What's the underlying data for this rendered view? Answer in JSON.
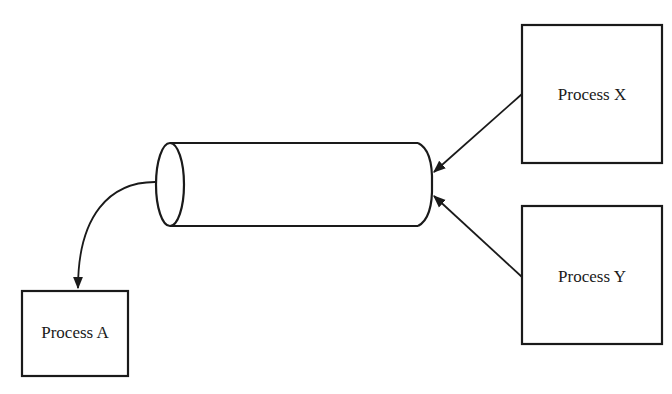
{
  "diagram": {
    "type": "pipe/queue communication diagram",
    "pipe": {
      "label": ""
    },
    "nodes": [
      {
        "id": "process_a",
        "label": "Process A"
      },
      {
        "id": "process_x",
        "label": "Process X"
      },
      {
        "id": "process_y",
        "label": "Process Y"
      }
    ],
    "edges": [
      {
        "from": "process_x",
        "to": "pipe-right-end"
      },
      {
        "from": "process_y",
        "to": "pipe-right-end"
      },
      {
        "from": "pipe-left-end",
        "to": "process_a"
      }
    ],
    "colors": {
      "stroke": "#1a1a1a",
      "background": "#ffffff"
    }
  }
}
